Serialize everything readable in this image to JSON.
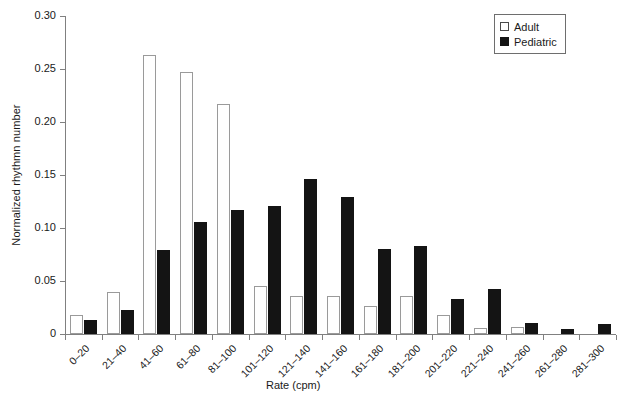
{
  "chart_data": {
    "type": "bar",
    "title": "",
    "xlabel": "Rate (cpm)",
    "ylabel": "Normalized rhythmn number",
    "ylim": [
      0,
      0.3
    ],
    "ytick_labels": [
      "0.30",
      "0.25",
      "0.20",
      "0.15",
      "0.10",
      "0.05",
      "0"
    ],
    "ytick_values": [
      0.3,
      0.25,
      0.2,
      0.15,
      0.1,
      0.05,
      0
    ],
    "grid": false,
    "legend_position": "top-right",
    "categories": [
      "0–20",
      "21–40",
      "41–60",
      "61–80",
      "81–100",
      "101–120",
      "121–140",
      "141–160",
      "161–180",
      "181–200",
      "201–220",
      "221–240",
      "241–260",
      "261–280",
      "281–300"
    ],
    "series": [
      {
        "name": "Adult",
        "color": "#ffffff",
        "edge_color": "#9a9a9a",
        "values": [
          0.018,
          0.04,
          0.263,
          0.247,
          0.217,
          0.045,
          0.036,
          0.036,
          0.026,
          0.036,
          0.018,
          0.006,
          0.007,
          0.0,
          0.0
        ]
      },
      {
        "name": "Pediatric",
        "color": "#141414",
        "edge_color": "#141414",
        "values": [
          0.013,
          0.023,
          0.079,
          0.106,
          0.117,
          0.121,
          0.146,
          0.129,
          0.08,
          0.083,
          0.033,
          0.042,
          0.01,
          0.005,
          0.009
        ]
      }
    ]
  },
  "legend": {
    "items": [
      {
        "label": "Adult",
        "marker": "open-square"
      },
      {
        "label": "Pediatric",
        "marker": "filled-square"
      }
    ]
  }
}
